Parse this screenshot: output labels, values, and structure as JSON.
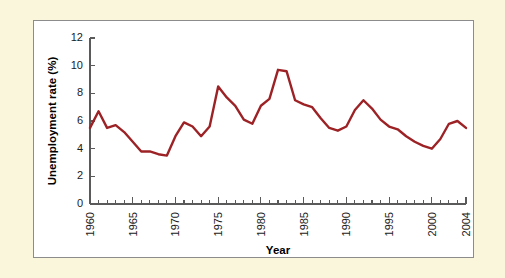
{
  "chart_data": {
    "type": "line",
    "title": "",
    "xlabel": "Year",
    "ylabel": "Unemployment rate (%)",
    "xlim": [
      1960,
      2004
    ],
    "ylim": [
      0,
      12
    ],
    "ytick_step": 2,
    "grid": false,
    "legend": "none",
    "line_color": "#9c2226",
    "yticks": [
      0,
      2,
      4,
      6,
      8,
      10,
      12
    ],
    "xticks": [
      1960,
      1961,
      1962,
      1963,
      1964,
      1965,
      1966,
      1967,
      1968,
      1969,
      1970,
      1971,
      1972,
      1973,
      1974,
      1975,
      1976,
      1977,
      1978,
      1979,
      1980,
      1981,
      1982,
      1983,
      1984,
      1985,
      1986,
      1987,
      1988,
      1989,
      1990,
      1991,
      1992,
      1993,
      1994,
      1995,
      1996,
      1997,
      1998,
      1999,
      2000,
      2001,
      2002,
      2003,
      2004
    ],
    "xtick_labels": [
      "1960",
      "1965",
      "1970",
      "1975",
      "1980",
      "1985",
      "1990",
      "1995",
      "2000",
      "2004"
    ],
    "xtick_label_values": [
      1960,
      1965,
      1970,
      1975,
      1980,
      1985,
      1990,
      1995,
      2000,
      2004
    ],
    "x": [
      1960,
      1961,
      1962,
      1963,
      1964,
      1965,
      1966,
      1967,
      1968,
      1969,
      1970,
      1971,
      1972,
      1973,
      1974,
      1975,
      1976,
      1977,
      1978,
      1979,
      1980,
      1981,
      1982,
      1983,
      1984,
      1985,
      1986,
      1987,
      1988,
      1989,
      1990,
      1991,
      1992,
      1993,
      1994,
      1995,
      1996,
      1997,
      1998,
      1999,
      2000,
      2001,
      2002,
      2003,
      2004
    ],
    "values": [
      5.5,
      6.7,
      5.5,
      5.7,
      5.2,
      4.5,
      3.8,
      3.8,
      3.6,
      3.5,
      4.9,
      5.9,
      5.6,
      4.9,
      5.6,
      8.5,
      7.7,
      7.1,
      6.1,
      5.8,
      7.1,
      7.6,
      9.7,
      9.6,
      7.5,
      7.2,
      7.0,
      6.2,
      5.5,
      5.3,
      5.6,
      6.8,
      7.5,
      6.9,
      6.1,
      5.6,
      5.4,
      4.9,
      4.5,
      4.2,
      4.0,
      4.7,
      5.8,
      6.0,
      5.5
    ]
  },
  "figure": {
    "panel_border_color": "#8c8c8c",
    "page_background": "#faf6dc",
    "panel_background": "#ffffff"
  }
}
